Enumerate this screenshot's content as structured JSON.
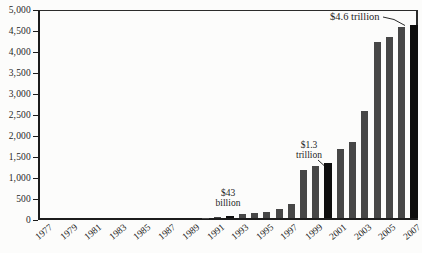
{
  "figure": {
    "background": "#fcfcfb",
    "axis_color": "#1c1c1c",
    "text_color": "#1f1f1f"
  },
  "chart_data": {
    "type": "bar",
    "title": "",
    "xlabel": "",
    "ylabel": "",
    "ylim": [
      0,
      5000
    ],
    "ytick_interval": 500,
    "ytick_labels": [
      "5,000",
      "4,500",
      "4,000",
      "3,500",
      "3,000",
      "2,500",
      "2,000",
      "1,500",
      "1,000",
      "500",
      "0"
    ],
    "xtick_labels": [
      "1977",
      "1979",
      "1981",
      "1983",
      "1985",
      "1987",
      "1989",
      "1991",
      "1993",
      "1995",
      "1997",
      "1999",
      "2001",
      "2003",
      "2005",
      "2007"
    ],
    "years": [
      1977,
      1978,
      1979,
      1980,
      1981,
      1982,
      1983,
      1984,
      1985,
      1986,
      1987,
      1988,
      1989,
      1990,
      1991,
      1992,
      1993,
      1994,
      1995,
      1996,
      1997,
      1998,
      1999,
      2000,
      2001,
      2002,
      2003,
      2004,
      2005,
      2006,
      2007
    ],
    "values": [
      0,
      0,
      0,
      0,
      0,
      0,
      0,
      0,
      0,
      0,
      0,
      0,
      0,
      10,
      25,
      43,
      100,
      125,
      155,
      205,
      325,
      1150,
      1230,
      1300,
      1640,
      1800,
      2550,
      4200,
      4300,
      4550,
      4600
    ],
    "bar_color": "#474747",
    "highlight_color": "#0e0e0e",
    "highlight_years": [
      1992,
      2000,
      2007
    ],
    "grid": false,
    "legend": null,
    "annotations": [
      {
        "line1": "$43",
        "line2": "billion",
        "target_year": 1992
      },
      {
        "line1": "$1.3",
        "line2": "trillion",
        "target_year": 2000
      },
      {
        "line1": "$4.6 trillion",
        "line2": "",
        "target_year": 2007
      }
    ]
  }
}
